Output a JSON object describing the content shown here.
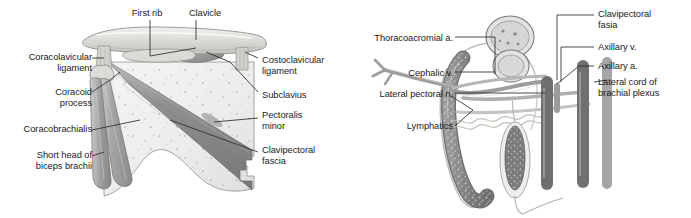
{
  "figure_left": {
    "name": "clavipectoral-fascia-dissection",
    "labels": [
      {
        "key": "first_rib",
        "text": "First rib",
        "align": "center",
        "x": 124,
        "y": 8,
        "w": 46
      },
      {
        "key": "clavicle",
        "text": "Clavicle",
        "align": "center",
        "x": 183,
        "y": 8,
        "w": 44
      },
      {
        "key": "coracoclavicular_ligament",
        "text": "Coracolavicular\nligament",
        "align": "right",
        "x": 4,
        "y": 52,
        "w": 88
      },
      {
        "key": "coracoid_process",
        "text": "Coracoid\nprocess",
        "align": "right",
        "x": 24,
        "y": 87,
        "w": 68
      },
      {
        "key": "coracobrachialis",
        "text": "Coracobrachialis",
        "align": "right",
        "x": 2,
        "y": 124,
        "w": 90
      },
      {
        "key": "short_head_biceps",
        "text": "Short head of\nbiceps brachii",
        "align": "right",
        "x": 14,
        "y": 150,
        "w": 78
      },
      {
        "key": "costoclavicular_ligament",
        "text": "Costoclavicular\nligament",
        "align": "left",
        "x": 262,
        "y": 55,
        "w": 82
      },
      {
        "key": "subclavius",
        "text": "Subclavius",
        "align": "left",
        "x": 262,
        "y": 90,
        "w": 60
      },
      {
        "key": "pectoralis_minor",
        "text": "Pectoralis\nminor",
        "align": "left",
        "x": 262,
        "y": 110,
        "w": 60
      },
      {
        "key": "clavipectoral_fascia",
        "text": "Clavipectoral\nfascia",
        "align": "left",
        "x": 262,
        "y": 145,
        "w": 72
      }
    ]
  },
  "figure_right": {
    "name": "clavipectoral-fascia-structures",
    "labels": [
      {
        "key": "thoracoacromial_artery",
        "text": "Thoracoacromial a.",
        "align": "right",
        "x": 2,
        "y": 33,
        "w": 106
      },
      {
        "key": "cephalic_vein",
        "text": "Cephalic v.",
        "align": "right",
        "x": 34,
        "y": 68,
        "w": 74
      },
      {
        "key": "lateral_pectoral_nerve",
        "text": "Lateral pectoral n.",
        "align": "right",
        "x": 2,
        "y": 89,
        "w": 106
      },
      {
        "key": "lymphatics",
        "text": "Lymphatics",
        "align": "right",
        "x": 38,
        "y": 121,
        "w": 70
      },
      {
        "key": "clavipectoral_fasia",
        "text": "Clavipectoral\nfasia",
        "align": "left",
        "x": 253,
        "y": 9,
        "w": 80
      },
      {
        "key": "axillary_vein",
        "text": "Axillary v.",
        "align": "left",
        "x": 253,
        "y": 42,
        "w": 62
      },
      {
        "key": "axillary_artery",
        "text": "Axillary a.",
        "align": "left",
        "x": 253,
        "y": 61,
        "w": 62
      },
      {
        "key": "lateral_cord",
        "text": "Lateral cord of\nbrachial plexus",
        "align": "left",
        "x": 253,
        "y": 77,
        "w": 90
      }
    ]
  },
  "colors": {
    "ink": "#1a1a1a",
    "leader_line": "#2b2b2b",
    "bone_light": "#e4e3e1",
    "bone_shade": "#c9c7c4",
    "fascia_fill": "#eeeeec",
    "fascia_stipple": "#b9bcc2",
    "muscle_dark": "#8e8e8e",
    "muscle_mid": "#a8a8a8",
    "muscle_light": "#c2c2c2",
    "vessel_grey": "#9a9a9a",
    "vessel_light": "#cccccc",
    "vein_dark": "#7d7d7d",
    "outline": "#6e6e6e",
    "background": "#ffffff"
  }
}
